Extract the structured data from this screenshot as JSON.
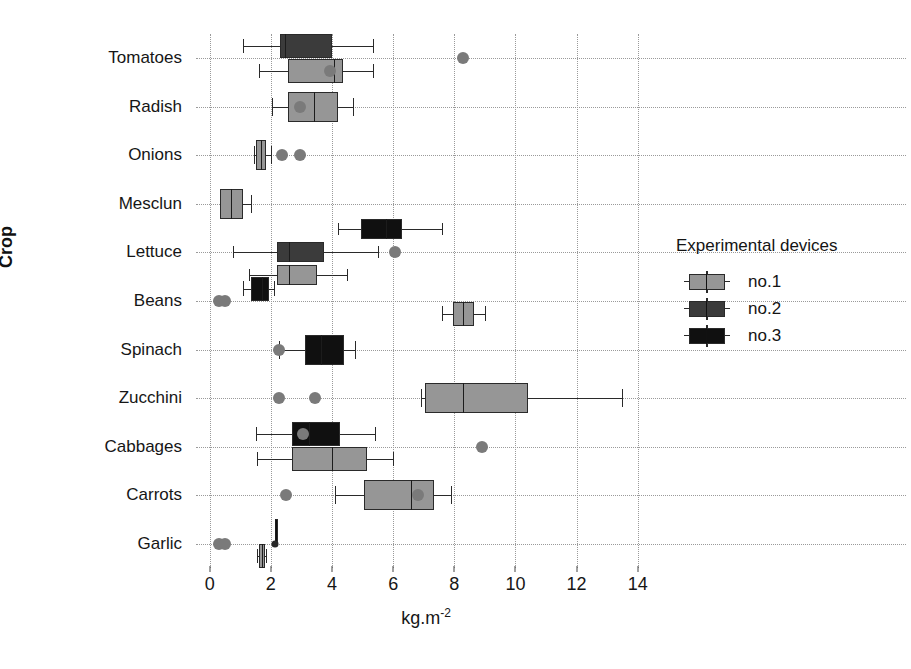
{
  "chart_data": {
    "type": "box",
    "title": "",
    "xlabel": "kg.m-2",
    "xlabel_base": "kg.m",
    "xlabel_exponent": "-2",
    "ylabel": "Crop",
    "xlim": [
      -0.45,
      14.6
    ],
    "xticks": [
      0,
      2,
      4,
      6,
      8,
      10,
      12,
      14
    ],
    "xticklabels": [
      "0",
      "2",
      "4",
      "6",
      "8",
      "10",
      "12",
      "14"
    ],
    "grid": "dotted-both",
    "categories": [
      "Tomatoes",
      "Radish",
      "Onions",
      "Mesclun",
      "Lettuce",
      "Beans",
      "Spinach",
      "Zucchini",
      "Cabbages",
      "Carrots",
      "Garlic"
    ],
    "legend": {
      "title": "Experimental devices",
      "position": "right",
      "entries": [
        {
          "label": "no.1",
          "color": "#969696"
        },
        {
          "label": "no.2",
          "color": "#3b3b3b"
        },
        {
          "label": "no.3",
          "color": "#101010"
        }
      ]
    },
    "series": [
      {
        "name": "no.1",
        "color": "#969696",
        "boxes": {
          "Tomatoes": {
            "whisker_low": 1.6,
            "q1": 2.55,
            "median": 4.05,
            "q3": 4.35,
            "whisker_high": 5.35,
            "mean": 3.95,
            "outliers": [
              8.3
            ]
          },
          "Radish": {
            "whisker_low": 2.05,
            "q1": 2.55,
            "median": 3.4,
            "q3": 4.2,
            "whisker_high": 4.7,
            "mean": 2.95,
            "outliers": []
          },
          "Onions": {
            "whisker_low": 1.45,
            "q1": 1.52,
            "median": 1.68,
            "q3": 1.85,
            "whisker_high": 2.0,
            "mean": null,
            "outliers": [
              2.35,
              2.95
            ]
          },
          "Mesclun": {
            "whisker_low": 0.35,
            "q1": 0.35,
            "median": 0.7,
            "q3": 1.1,
            "whisker_high": 1.35,
            "mean": null,
            "outliers": []
          },
          "Lettuce": {
            "whisker_low": 1.3,
            "q1": 2.2,
            "median": 2.6,
            "q3": 3.5,
            "whisker_high": 4.5,
            "mean": null,
            "outliers": []
          },
          "Beans": {
            "whisker_low": 7.6,
            "q1": 7.95,
            "median": 8.3,
            "q3": 8.65,
            "whisker_high": 9.0,
            "mean": null,
            "outliers": []
          },
          "Spinach": null,
          "Zucchini": {
            "whisker_low": 6.9,
            "q1": 7.05,
            "median": 8.3,
            "q3": 10.4,
            "whisker_high": 13.5,
            "mean": null,
            "outliers": [
              2.25,
              3.45
            ]
          },
          "Cabbages": {
            "whisker_low": 1.55,
            "q1": 2.7,
            "median": 4.0,
            "q3": 5.15,
            "whisker_high": 6.0,
            "mean": null,
            "outliers": [
              8.9
            ]
          },
          "Carrots": {
            "whisker_low": 4.1,
            "q1": 5.05,
            "median": 6.6,
            "q3": 7.35,
            "whisker_high": 7.9,
            "mean": 6.8,
            "outliers": [
              2.5
            ]
          },
          "Garlic": {
            "whisker_low": 1.55,
            "q1": 1.6,
            "median": 1.7,
            "q3": 1.82,
            "whisker_high": 1.85,
            "mean": null,
            "outliers": [
              0.3,
              0.5
            ]
          }
        }
      },
      {
        "name": "no.2",
        "color": "#3b3b3b",
        "boxes": {
          "Tomatoes": {
            "whisker_low": 1.1,
            "q1": 2.3,
            "median": 2.45,
            "q3": 4.0,
            "whisker_high": 5.35,
            "mean": null,
            "outliers": []
          },
          "Radish": null,
          "Onions": null,
          "Mesclun": null,
          "Lettuce": {
            "whisker_low": 0.75,
            "q1": 2.2,
            "median": 2.6,
            "q3": 3.75,
            "whisker_high": 5.5,
            "mean": null,
            "outliers": []
          },
          "Beans": null,
          "Spinach": null,
          "Zucchini": null,
          "Cabbages": null,
          "Carrots": null,
          "Garlic": null
        }
      },
      {
        "name": "no.3",
        "color": "#101010",
        "boxes": {
          "Tomatoes": null,
          "Radish": null,
          "Onions": null,
          "Mesclun": null,
          "Lettuce": {
            "whisker_low": 4.2,
            "q1": 4.95,
            "median": 5.75,
            "q3": 6.3,
            "whisker_high": 7.6,
            "mean": null,
            "outliers": [
              6.05
            ]
          },
          "Beans": {
            "whisker_low": 1.1,
            "q1": 1.35,
            "median": 1.7,
            "q3": 1.95,
            "whisker_high": 2.1,
            "mean": null,
            "outliers": [
              0.3,
              0.5
            ]
          },
          "Spinach": {
            "whisker_low": 2.25,
            "q1": 3.1,
            "median": 3.65,
            "q3": 4.4,
            "whisker_high": 4.75,
            "mean": null,
            "outliers": [
              2.25
            ]
          },
          "Zucchini": null,
          "Cabbages": {
            "whisker_low": 1.5,
            "q1": 2.7,
            "median": 3.25,
            "q3": 4.25,
            "whisker_high": 5.4,
            "mean": 3.05,
            "outliers": []
          },
          "Carrots": null,
          "Garlic": {
            "whisker_low": 2.15,
            "q1": 2.15,
            "median": 2.15,
            "q3": 2.15,
            "whisker_high": 2.15,
            "mean": null,
            "outliers": [
              2.15
            ]
          }
        }
      }
    ]
  }
}
